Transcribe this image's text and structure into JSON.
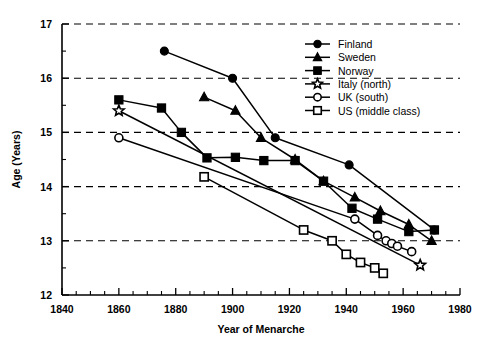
{
  "chart_data": {
    "type": "line",
    "title": "",
    "xlabel": "Year of Menarche",
    "ylabel": "Age (Years)",
    "xlim": [
      1840,
      1980
    ],
    "ylim": [
      12,
      17
    ],
    "xticks": [
      1840,
      1860,
      1880,
      1900,
      1920,
      1940,
      1960,
      1980
    ],
    "yticks": [
      12,
      13,
      14,
      15,
      16,
      17
    ],
    "xtick_minor_step": 5,
    "ytick_minor_step": 0.5,
    "grid": "horizontal-dashed",
    "legend_position": "top-right",
    "series": [
      {
        "name": "Finland",
        "marker": "filled-circle",
        "x": [
          1876,
          1900,
          1915,
          1941,
          1971
        ],
        "y": [
          16.5,
          16.0,
          14.9,
          14.4,
          13.2
        ]
      },
      {
        "name": "Sweden",
        "marker": "filled-triangle",
        "x": [
          1890,
          1901,
          1910,
          1922,
          1932,
          1943,
          1952,
          1962,
          1970
        ],
        "y": [
          15.65,
          15.4,
          14.9,
          14.5,
          14.1,
          13.8,
          13.55,
          13.3,
          13.0
        ]
      },
      {
        "name": "Norway",
        "marker": "filled-square",
        "x": [
          1860,
          1875,
          1882,
          1891,
          1901,
          1911,
          1922,
          1932,
          1942,
          1951,
          1962,
          1971
        ],
        "y": [
          15.6,
          15.45,
          15.0,
          14.53,
          14.54,
          14.48,
          14.48,
          14.1,
          13.6,
          13.4,
          13.17,
          13.2
        ]
      },
      {
        "name": "Italy (north)",
        "marker": "open-star",
        "x": [
          1860,
          1966
        ],
        "y": [
          15.4,
          12.55
        ]
      },
      {
        "name": "UK (south)",
        "marker": "open-circle",
        "x": [
          1860,
          1943,
          1951,
          1954,
          1956,
          1958,
          1963
        ],
        "y": [
          14.9,
          13.4,
          13.1,
          13.0,
          12.95,
          12.9,
          12.8
        ]
      },
      {
        "name": "US (middle class)",
        "marker": "open-square",
        "x": [
          1890,
          1925,
          1935,
          1940,
          1945,
          1950,
          1953
        ],
        "y": [
          14.18,
          13.2,
          13.0,
          12.75,
          12.6,
          12.5,
          12.4
        ]
      }
    ]
  },
  "legend": {
    "entries": [
      {
        "label": "Finland",
        "marker": "filled-circle"
      },
      {
        "label": "Sweden",
        "marker": "filled-triangle"
      },
      {
        "label": "Norway",
        "marker": "filled-square"
      },
      {
        "label": "Italy (north)",
        "marker": "open-star"
      },
      {
        "label": "UK (south)",
        "marker": "open-circle"
      },
      {
        "label": "US (middle class)",
        "marker": "open-square"
      }
    ]
  },
  "colors": {
    "ink": "#000000",
    "background": "#ffffff"
  }
}
